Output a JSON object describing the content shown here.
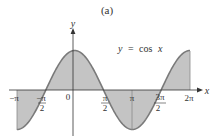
{
  "figure": {
    "panel_label": "(a)",
    "equation_label_y": "y",
    "equation_label_eq": "=",
    "equation_label_fn": "cos",
    "equation_label_x": "x",
    "x_axis_label": "x",
    "y_axis_label": "y",
    "tick_labels": {
      "neg_pi": "−π",
      "neg_pi_half_num": "−π",
      "neg_pi_half_den": "2",
      "zero": "0",
      "pi_half_num": "π",
      "pi_half_den": "2",
      "pi": "π",
      "three_pi_half_num": "3π",
      "three_pi_half_den": "2",
      "two_pi": "2π"
    },
    "colors": {
      "curve": "#7a7a7a",
      "fill": "#c4c4c4",
      "axis": "#333333",
      "text": "#333333"
    }
  },
  "chart_data": {
    "type": "area",
    "title": "(a)",
    "function": "y = cos x",
    "xlabel": "x",
    "ylabel": "y",
    "x_range": [
      -3.14159,
      6.28319
    ],
    "y_range": [
      -1,
      1
    ],
    "x_ticks": [
      {
        "value": -3.14159,
        "label": "-π"
      },
      {
        "value": -1.5708,
        "label": "-π/2"
      },
      {
        "value": 0,
        "label": "0"
      },
      {
        "value": 1.5708,
        "label": "π/2"
      },
      {
        "value": 3.14159,
        "label": "π"
      },
      {
        "value": 4.71239,
        "label": "3π/2"
      },
      {
        "value": 6.28319,
        "label": "2π"
      }
    ],
    "x": [
      -3.14159,
      -2.35619,
      -1.5708,
      -0.7854,
      0,
      0.7854,
      1.5708,
      2.35619,
      3.14159,
      3.92699,
      4.71239,
      5.49779,
      6.28319
    ],
    "values": [
      -1,
      -0.7071,
      0,
      0.7071,
      1,
      0.7071,
      0,
      -0.7071,
      -1,
      -0.7071,
      0,
      0.7071,
      1
    ],
    "shaded": "region between curve and x-axis",
    "grid": false,
    "legend": "none",
    "annotations": [
      "y = cos x"
    ]
  }
}
